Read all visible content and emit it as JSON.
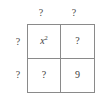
{
  "figure": {
    "kind": "box-method-grid",
    "rows": 2,
    "columns": 2,
    "line_color": "#8a8a8a",
    "text_color": "#3c3c3c",
    "background_color": "#ffffff"
  },
  "column_labels": [
    {
      "name": "column-label-left",
      "text": "?"
    },
    {
      "name": "column-label-right",
      "text": "?"
    }
  ],
  "row_labels": [
    {
      "name": "row-label-top",
      "text": "?"
    },
    {
      "name": "row-label-bottom",
      "text": "?"
    }
  ],
  "cells": {
    "top_left": {
      "text": "x",
      "exponent": "2",
      "is_unknown": false
    },
    "top_right": {
      "text": "?",
      "exponent": "",
      "is_unknown": true
    },
    "bottom_left": {
      "text": "?",
      "exponent": "",
      "is_unknown": true
    },
    "bottom_right": {
      "text": "9",
      "exponent": "",
      "is_unknown": false
    }
  }
}
